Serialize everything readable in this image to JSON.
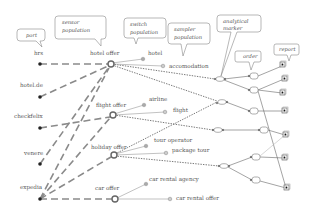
{
  "diagram": {
    "type": "network-flow",
    "callouts": [
      {
        "id": "port",
        "lines": [
          "port"
        ]
      },
      {
        "id": "sensor",
        "lines": [
          "sensor",
          "population"
        ]
      },
      {
        "id": "switch",
        "lines": [
          "switch",
          "population"
        ]
      },
      {
        "id": "sampler",
        "lines": [
          "sampler",
          "population"
        ]
      },
      {
        "id": "analytical",
        "lines": [
          "analytical",
          "marker"
        ]
      },
      {
        "id": "order",
        "lines": [
          "order"
        ]
      },
      {
        "id": "report",
        "lines": [
          "report"
        ]
      }
    ],
    "ports": [
      {
        "id": "hrs",
        "label": "hrs"
      },
      {
        "id": "hotelde",
        "label": "hotel.de"
      },
      {
        "id": "checkfelix",
        "label": "checkfelix"
      },
      {
        "id": "venere",
        "label": "venere"
      },
      {
        "id": "expedia",
        "label": "expedia"
      }
    ],
    "sensors": [
      {
        "id": "hotel_offer",
        "label": "hotel offer"
      },
      {
        "id": "flight_offer",
        "label": "flight offer"
      },
      {
        "id": "holiday_offer",
        "label": "holiday offer"
      },
      {
        "id": "car_offer",
        "label": "car offer"
      }
    ],
    "switches": [
      {
        "id": "hotel",
        "label": "hotel"
      },
      {
        "id": "airline",
        "label": "airline"
      },
      {
        "id": "tour_operator",
        "label": "tour operator"
      },
      {
        "id": "car_rental_agency",
        "label": "car rental agency"
      }
    ],
    "samplers": [
      {
        "id": "accomodation",
        "label": "accomodation"
      },
      {
        "id": "flight",
        "label": "flight"
      },
      {
        "id": "package_tour",
        "label": "package tour"
      },
      {
        "id": "car_rental_offer",
        "label": "car rental offer"
      }
    ],
    "edges": {
      "port_to_sensor": [
        [
          "hrs",
          "hotel_offer"
        ],
        [
          "hotelde",
          "hotel_offer"
        ],
        [
          "checkfelix",
          "flight_offer"
        ],
        [
          "venere",
          "hotel_offer"
        ],
        [
          "expedia",
          "hotel_offer"
        ],
        [
          "expedia",
          "flight_offer"
        ],
        [
          "expedia",
          "holiday_offer"
        ],
        [
          "expedia",
          "car_offer"
        ]
      ],
      "sensor_to_marker_count": 6,
      "marker_count": 4,
      "order_count": 6,
      "report_count": 7
    },
    "colors": {
      "dashed_edge": "#8a8a8a",
      "text": "#555555",
      "node_fill": "#aaaaaa"
    }
  }
}
